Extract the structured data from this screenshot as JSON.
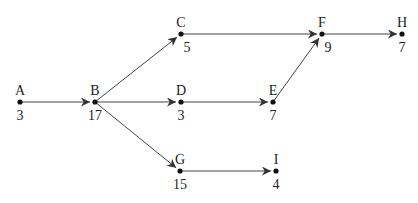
{
  "diagram": {
    "type": "directed-network",
    "nodes": [
      {
        "id": "A",
        "label": "A",
        "value": "3",
        "x": 20,
        "y": 102
      },
      {
        "id": "B",
        "label": "B",
        "value": "17",
        "x": 95,
        "y": 102
      },
      {
        "id": "C",
        "label": "C",
        "value": "5",
        "x": 181,
        "y": 34
      },
      {
        "id": "D",
        "label": "D",
        "value": "3",
        "x": 181,
        "y": 102
      },
      {
        "id": "E",
        "label": "E",
        "value": "7",
        "x": 273,
        "y": 102
      },
      {
        "id": "F",
        "label": "F",
        "value": "9",
        "x": 322,
        "y": 34
      },
      {
        "id": "H",
        "label": "H",
        "value": "7",
        "x": 402,
        "y": 34
      },
      {
        "id": "G",
        "label": "G",
        "value": "15",
        "x": 180,
        "y": 171
      },
      {
        "id": "I",
        "label": "I",
        "value": "4",
        "x": 276,
        "y": 171
      }
    ],
    "edges": [
      {
        "from": "A",
        "to": "B"
      },
      {
        "from": "B",
        "to": "C"
      },
      {
        "from": "B",
        "to": "D"
      },
      {
        "from": "B",
        "to": "G"
      },
      {
        "from": "C",
        "to": "F"
      },
      {
        "from": "D",
        "to": "E"
      },
      {
        "from": "E",
        "to": "F"
      },
      {
        "from": "F",
        "to": "H"
      },
      {
        "from": "G",
        "to": "I"
      }
    ]
  }
}
